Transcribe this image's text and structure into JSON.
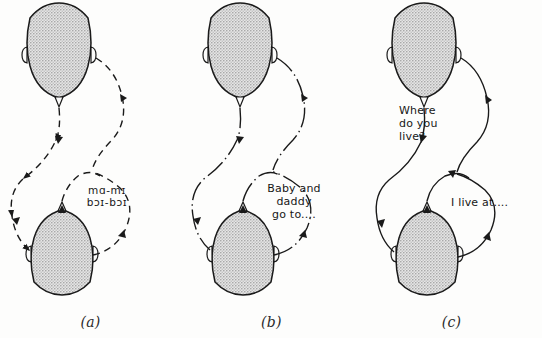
{
  "figure": {
    "background_color": "#fdfdfc",
    "ink_color": "#1a1a1a",
    "head_fill_color": "#b5b5b5"
  },
  "panels": [
    {
      "id": "a",
      "caption": "(a)",
      "line_style": "dashed",
      "speech": [
        {
          "name": "phonetic-babble",
          "lines": "mɑ-mɪ\nbɔɪ-bɔɪ",
          "style": "phonetic"
        }
      ],
      "heads": [
        {
          "name": "upper-head",
          "orientation": "nose-down"
        },
        {
          "name": "lower-head",
          "orientation": "nose-up"
        }
      ]
    },
    {
      "id": "b",
      "caption": "(b)",
      "line_style": "dash-dot",
      "speech": [
        {
          "name": "child-utterance",
          "lines": "Baby and\ndaddy\ngo to....",
          "style": "normal"
        }
      ],
      "heads": [
        {
          "name": "upper-head",
          "orientation": "nose-down"
        },
        {
          "name": "lower-head",
          "orientation": "nose-up"
        }
      ]
    },
    {
      "id": "c",
      "caption": "(c)",
      "line_style": "solid",
      "speech": [
        {
          "name": "question-utterance",
          "lines": "Where\ndo you\nlive?",
          "style": "normal"
        },
        {
          "name": "answer-utterance",
          "lines": "I live at....",
          "style": "normal"
        }
      ],
      "heads": [
        {
          "name": "upper-head",
          "orientation": "nose-down"
        },
        {
          "name": "lower-head",
          "orientation": "nose-up"
        }
      ]
    }
  ]
}
